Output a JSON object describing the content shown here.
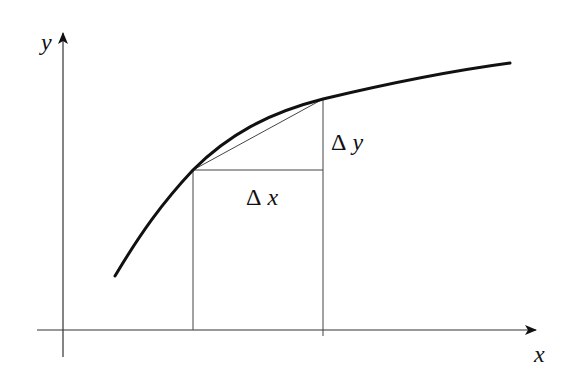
{
  "diagram": {
    "type": "derivative-secant-illustration",
    "axes": {
      "x_label": "x",
      "y_label": "y"
    },
    "labels": {
      "delta_x": {
        "symbol": "Δ",
        "var": "x"
      },
      "delta_y": {
        "symbol": "Δ",
        "var": "y"
      }
    },
    "colors": {
      "curve": "#111111",
      "axes": "#333333",
      "guides": "#444444",
      "background": "#ffffff"
    }
  }
}
